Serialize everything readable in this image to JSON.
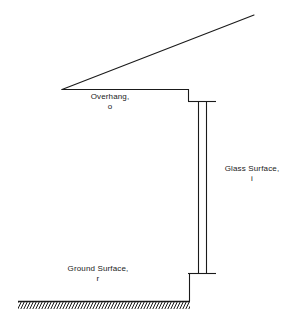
{
  "diagram": {
    "stroke_color": "#1a1a1a",
    "background_color": "#ffffff",
    "labels": {
      "overhang": {
        "text": "Overhang,",
        "subscript": "o"
      },
      "glass": {
        "text": "Glass Surface,",
        "subscript": "i"
      },
      "ground": {
        "text": "Ground Surface,",
        "subscript": "r"
      }
    },
    "geometry": {
      "roof_slope_apex": [
        62,
        89
      ],
      "roof_slope_tip": [
        254,
        15
      ],
      "overhang_soffit_start": [
        62,
        89
      ],
      "overhang_soffit_end": [
        188,
        89
      ],
      "wall_head_drop_to": [
        188,
        101
      ],
      "glass_top_tick": {
        "x1": 190,
        "x2": 216,
        "y": 101
      },
      "glass_bottom_tick": {
        "x1": 190,
        "x2": 216,
        "y": 273
      },
      "glass_pane_left_x": 198,
      "glass_pane_right_x": 206,
      "glass_top_y": 101,
      "glass_bottom_y": 273,
      "wall_base_x": 190,
      "wall_base_top_y": 273,
      "wall_base_bottom_y": 301,
      "ground_line": {
        "x1": 18,
        "x2": 190,
        "y": 301
      },
      "hatch_spacing_px": 3,
      "hatch_height_px": 7,
      "hatch_direction": "down-right"
    }
  }
}
